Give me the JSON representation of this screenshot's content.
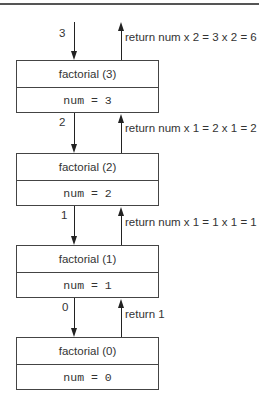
{
  "diagram": {
    "type": "recursion-call-stack",
    "frames": [
      {
        "title": "factorial (3)",
        "var": "num = 3"
      },
      {
        "title": "factorial (2)",
        "var": "num = 2"
      },
      {
        "title": "factorial (1)",
        "var": "num = 1"
      },
      {
        "title": "factorial (0)",
        "var": "num = 0"
      }
    ],
    "call_args": [
      "3",
      "2",
      "1",
      "0"
    ],
    "returns": [
      "return num x 2 = 3 x 2 = 6",
      "return num x 1 = 2 x 1 = 2",
      "return num x 1 = 1 x 1 = 1",
      "return 1"
    ],
    "colors": {
      "line": "#222222",
      "border": "#444444",
      "text": "#333333",
      "rule": "#555555"
    }
  }
}
